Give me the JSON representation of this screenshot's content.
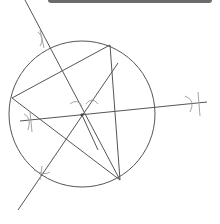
{
  "diagram": {
    "title": "",
    "colors": {
      "stroke": "#555555",
      "arc": "#9a9a9a",
      "bar": "#6b6b6b",
      "background": "#ffffff"
    },
    "circle": {
      "cx": 82,
      "cy": 114,
      "r": 73
    },
    "triangle": [
      [
        12,
        98
      ],
      [
        110,
        45
      ],
      [
        120,
        180
      ]
    ],
    "lines": [
      {
        "x1": 25,
        "y1": 0,
        "x2": 120,
        "y2": 180
      },
      {
        "x1": 20,
        "y1": 121,
        "x2": 207,
        "y2": 102
      },
      {
        "x1": 18,
        "y1": 210,
        "x2": 118,
        "y2": 63
      },
      {
        "x1": 82,
        "y1": 115,
        "x2": 98,
        "y2": 150
      }
    ],
    "center_point": {
      "x": 82,
      "y": 115
    }
  }
}
